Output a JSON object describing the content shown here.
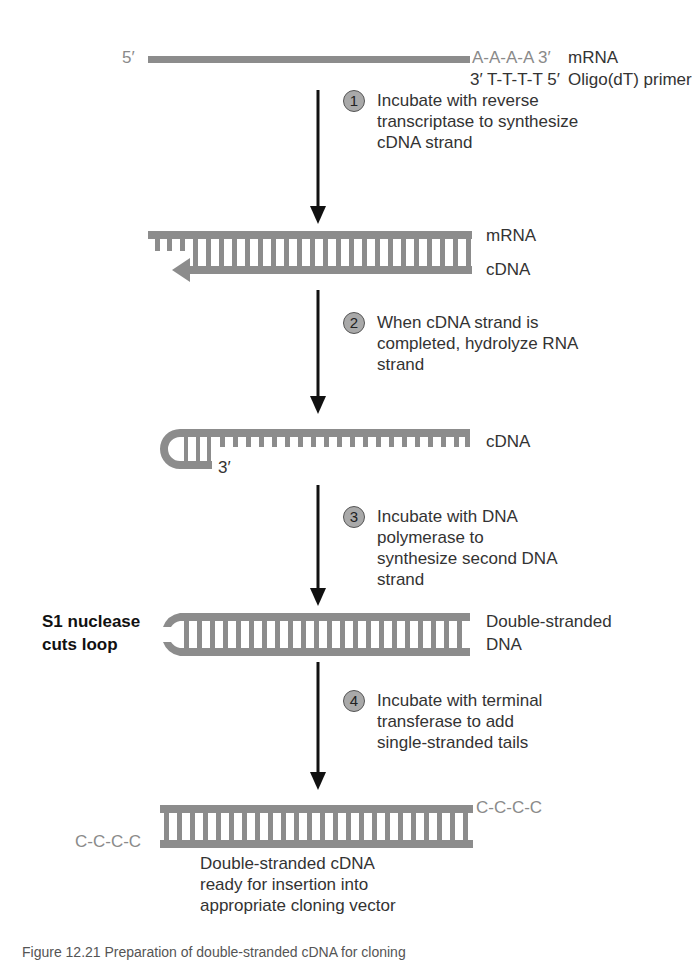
{
  "figure": {
    "title": "Preparation of double-stranded cDNA",
    "colors": {
      "strand": "#8c8c8c",
      "arrow": "#111111",
      "step_circle": "#a9a9a9",
      "text": "#333333",
      "faded_text": "#8a8a8a"
    }
  },
  "stage0": {
    "five_prime": "5′",
    "polyA": "A-A-A-A 3′",
    "mrna_label": "mRNA",
    "primer_seq": "3′ T-T-T-T 5′",
    "primer_label": "Oligo(dT) primer"
  },
  "steps": [
    {
      "number": "1",
      "text": "Incubate with reverse\ntranscriptase to synthesize\ncDNA strand"
    },
    {
      "number": "2",
      "text": "When cDNA strand is\ncompleted, hydrolyze RNA\nstrand"
    },
    {
      "number": "3",
      "text": "Incubate with DNA\npolymerase to\nsynthesize second DNA\nstrand"
    },
    {
      "number": "4",
      "text": "Incubate with terminal\ntransferase to add\nsingle-stranded tails"
    }
  ],
  "stage1": {
    "top_label": "mRNA",
    "bottom_label": "cDNA"
  },
  "stage2": {
    "label": "cDNA",
    "end_label": "3′"
  },
  "stage3": {
    "side_note": "S1 nuclease\ncuts loop",
    "label_line1": "Double-stranded",
    "label_line2": "DNA"
  },
  "stage4": {
    "left_tail": "C-C-C-C",
    "right_tail": "C-C-C-C",
    "result_text": "Double-stranded cDNA\nready for insertion into\nappropriate cloning vector"
  },
  "caption": "Figure 12.21   Preparation of double-stranded cDNA for cloning"
}
